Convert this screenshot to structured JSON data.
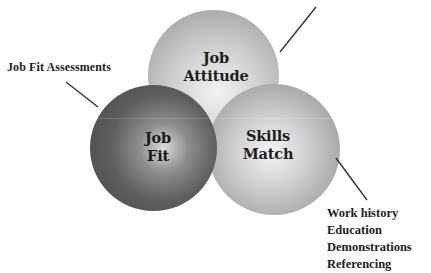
{
  "diagram": {
    "type": "three-circle overlapping diagram",
    "circles": [
      {
        "id": "attitude",
        "line1": "Job",
        "line2": "Attitude",
        "shade": "light-gray",
        "edge_color": "#979797",
        "center_color": "#f2f2f2"
      },
      {
        "id": "fit",
        "line1": "Job",
        "line2": "Fit",
        "shade": "dark-gray",
        "edge_color": "#474747",
        "center_color": "#dcdcdc"
      },
      {
        "id": "skills",
        "line1": "Skills",
        "line2": "Match",
        "shade": "medium-gray",
        "edge_color": "#8c8c8c",
        "center_color": "#f4f4f4"
      }
    ],
    "callouts": {
      "fit": {
        "label": "Job Fit Assessments"
      },
      "attitude": {
        "label": ""
      },
      "skills": {
        "items": [
          "Work history",
          "Education",
          "Demonstrations",
          "Referencing"
        ]
      }
    },
    "connectors": [
      {
        "name": "attitude-connector",
        "x1": 280,
        "y1": 52,
        "x2": 316,
        "y2": 7
      },
      {
        "name": "fit-connector",
        "x1": 66,
        "y1": 82,
        "x2": 98,
        "y2": 107
      },
      {
        "name": "skills-connector",
        "x1": 336,
        "y1": 158,
        "x2": 367,
        "y2": 200
      }
    ],
    "line_color": "#333333"
  }
}
